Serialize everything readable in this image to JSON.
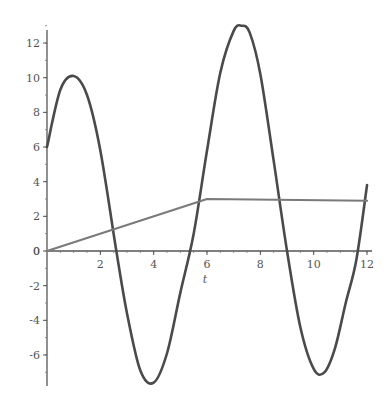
{
  "chart_data": {
    "type": "line",
    "title": "",
    "xlabel": "t",
    "ylabel": "",
    "xlim": [
      0,
      12
    ],
    "ylim": [
      -7.6,
      13.2
    ],
    "grid": false,
    "legend": null,
    "x_ticks": [
      2,
      4,
      6,
      8,
      10,
      12
    ],
    "y_ticks": [
      -6,
      -4,
      -2,
      0,
      2,
      4,
      6,
      8,
      10,
      12
    ],
    "series": [
      {
        "name": "oscillation",
        "color": "#4a4a4a",
        "x": [
          0,
          0.5,
          1.0,
          1.5,
          2.0,
          2.6,
          3.0,
          3.5,
          4.0,
          4.5,
          5.0,
          5.5,
          6.0,
          6.5,
          7.0,
          7.3,
          7.6,
          8.0,
          8.5,
          9.0,
          9.5,
          10.0,
          10.4,
          10.8,
          11.2,
          11.6,
          12.0
        ],
        "y": [
          6.0,
          9.3,
          10.1,
          9.0,
          5.8,
          0.0,
          -3.6,
          -6.9,
          -7.6,
          -5.9,
          -2.4,
          1.0,
          5.8,
          10.3,
          12.7,
          13.0,
          12.6,
          10.2,
          5.2,
          0.0,
          -4.4,
          -6.8,
          -7.0,
          -5.6,
          -3.0,
          -0.5,
          3.8
        ]
      },
      {
        "name": "ramp",
        "color": "#7a7a7a",
        "x": [
          0,
          6,
          12
        ],
        "y": [
          0,
          3.0,
          2.9
        ]
      }
    ]
  },
  "layout": {
    "plot": {
      "x0_px": 47,
      "x1_px": 367,
      "y0_px": 251,
      "y_unit_px": 17.33,
      "x_unit_px": 26.67
    },
    "y_axis_top_px": 30,
    "y_axis_bottom_px": 386,
    "x_axis_left_px": 47,
    "x_axis_right_px": 372
  }
}
